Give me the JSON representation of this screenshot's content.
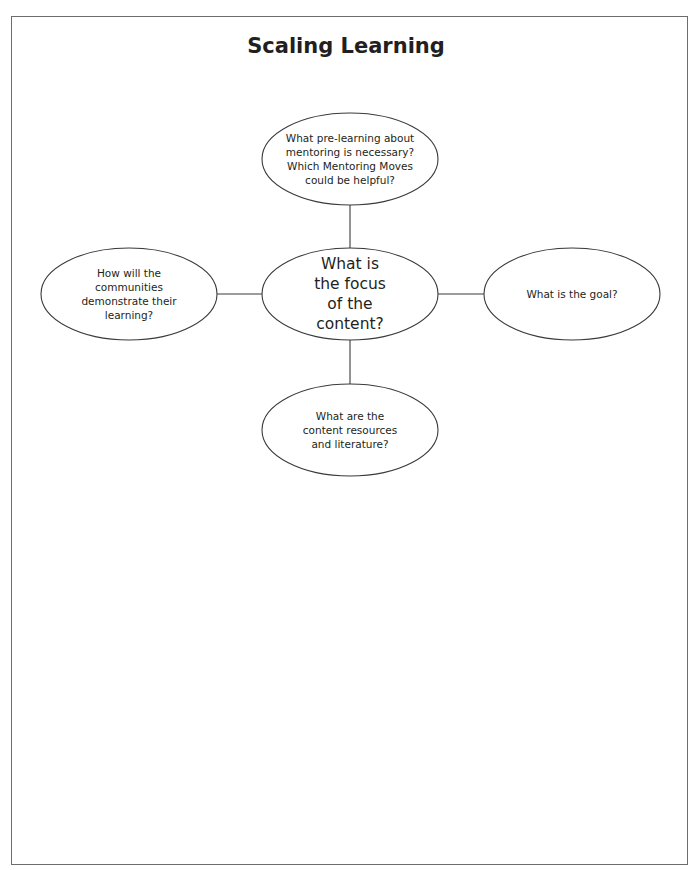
{
  "title": "Scaling Learning",
  "diagram": {
    "center": {
      "label": "What is\nthe focus\nof the\ncontent?"
    },
    "nodes": {
      "top": {
        "label": "What pre-learning about\nmentoring is necessary?\nWhich Mentoring Moves\ncould be helpful?"
      },
      "left": {
        "label": "How will the\ncommunities\ndemonstrate their\nlearning?"
      },
      "right": {
        "label": "What is the goal?"
      },
      "bottom": {
        "label": "What are the\ncontent resources\nand literature?"
      }
    },
    "colors": {
      "stroke": "#3a3a3a",
      "text": "#231f20",
      "frame": "#6d6d6d",
      "background": "#ffffff"
    }
  }
}
